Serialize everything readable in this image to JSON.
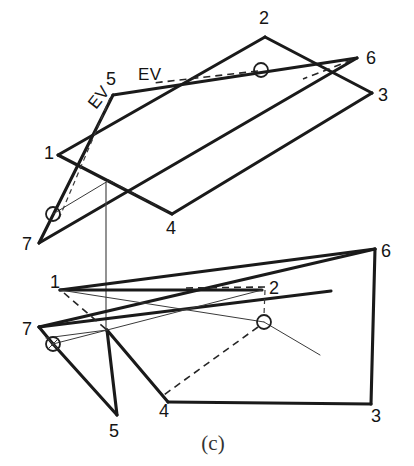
{
  "figure": {
    "caption": "(c)",
    "type": "descriptive-geometry-drawing",
    "ink_color": "#1a1a1a",
    "background_color": "#ffffff",
    "upper_view": {
      "name": "edge-view-auxiliary",
      "ev_labels": [
        {
          "text": "EV",
          "x": 138,
          "y": 80,
          "rotation": 0
        },
        {
          "text": "EV",
          "x": 96,
          "y": 110,
          "rotation": -52
        }
      ],
      "vertex_labels": [
        {
          "id": "5",
          "text": "5",
          "x": 106,
          "y": 85
        },
        {
          "id": "2",
          "text": "2",
          "x": 259,
          "y": 24
        },
        {
          "id": "6",
          "text": "6",
          "x": 366,
          "y": 64
        },
        {
          "id": "3",
          "text": "3",
          "x": 378,
          "y": 101
        },
        {
          "id": "1",
          "text": "1",
          "x": 44,
          "y": 159
        },
        {
          "id": "4",
          "text": "4",
          "x": 166,
          "y": 234
        },
        {
          "id": "7",
          "text": "7",
          "x": 22,
          "y": 250
        }
      ],
      "vertices": {
        "p1": [
          58,
          155
        ],
        "p2": [
          265,
          37
        ],
        "p3": [
          372,
          93
        ],
        "p4": [
          172,
          214
        ],
        "p5": [
          113,
          95
        ],
        "p6": [
          357,
          58
        ],
        "p7": [
          39,
          243
        ]
      },
      "markers": [
        {
          "name": "pierce-point-upper-right",
          "x": 261,
          "y": 70,
          "r": 7,
          "cross": false
        },
        {
          "name": "pierce-point-upper-left",
          "x": 53,
          "y": 214,
          "r": 7,
          "cross": false
        }
      ]
    },
    "lower_view": {
      "name": "principal-view",
      "vertex_labels": [
        {
          "id": "1",
          "text": "1",
          "x": 50,
          "y": 288
        },
        {
          "id": "2",
          "text": "2",
          "x": 269,
          "y": 294
        },
        {
          "id": "6",
          "text": "6",
          "x": 381,
          "y": 257
        },
        {
          "id": "7",
          "text": "7",
          "x": 22,
          "y": 335
        },
        {
          "id": "5",
          "text": "5",
          "x": 109,
          "y": 437
        },
        {
          "id": "4",
          "text": "4",
          "x": 159,
          "y": 417
        },
        {
          "id": "3",
          "text": "3",
          "x": 371,
          "y": 422
        }
      ],
      "vertices": {
        "p1": [
          60,
          290
        ],
        "p2": [
          262,
          290
        ],
        "p3": [
          371,
          404
        ],
        "p4": [
          168,
          402
        ],
        "p5": [
          117,
          415
        ],
        "p6": [
          375,
          249
        ],
        "p7": [
          39,
          327
        ]
      },
      "markers": [
        {
          "name": "pierce-point-lower-right",
          "x": 264,
          "y": 322,
          "r": 7,
          "cross": false
        },
        {
          "name": "pierce-point-lower-left",
          "x": 53,
          "y": 344,
          "r": 7,
          "cross": true
        }
      ]
    },
    "projection_line": {
      "x": 106,
      "y_top": 182,
      "y_bottom": 332
    }
  }
}
